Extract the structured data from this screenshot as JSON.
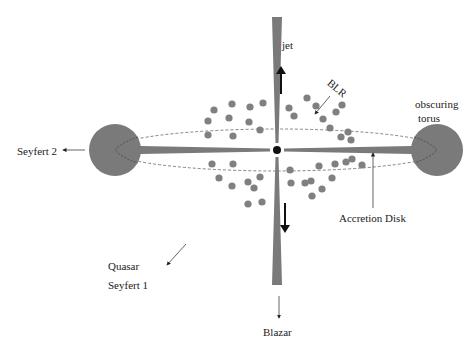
{
  "colors": {
    "background": "#ffffff",
    "structure_gray": "#7a7a7a",
    "blob_gray": "#808080",
    "dark": "#111111",
    "text": "#222222"
  },
  "labels": {
    "jet": "jet",
    "blr": "BLR",
    "obscuring": "obscuring",
    "torus": "torus",
    "seyfert2": "Seyfert 2",
    "accretion_disk": "Accretion Disk",
    "quasar": "Quasar",
    "seyfert1": "Seyfert 1",
    "blazar": "Blazar"
  },
  "geometry": {
    "center": [
      277,
      150
    ],
    "left_torus": {
      "cx": 115,
      "cy": 150,
      "r": 26
    },
    "right_torus": {
      "cx": 437,
      "cy": 150,
      "r": 26
    },
    "ellipse": {
      "cx": 277,
      "cy": 150,
      "rx": 165,
      "ry": 22
    },
    "jet_top_y": 17,
    "jet_bottom_y": 285
  },
  "blobs": [
    [
      263,
      103
    ],
    [
      232,
      104
    ],
    [
      214,
      110
    ],
    [
      208,
      121
    ],
    [
      229,
      118
    ],
    [
      250,
      107
    ],
    [
      249,
      122
    ],
    [
      208,
      135
    ],
    [
      233,
      136
    ],
    [
      260,
      130
    ],
    [
      289,
      108
    ],
    [
      294,
      116
    ],
    [
      307,
      98
    ],
    [
      316,
      106
    ],
    [
      323,
      119
    ],
    [
      336,
      112
    ],
    [
      330,
      128
    ],
    [
      341,
      137
    ],
    [
      348,
      132
    ],
    [
      351,
      140
    ],
    [
      342,
      105
    ],
    [
      212,
      164
    ],
    [
      233,
      164
    ],
    [
      219,
      178
    ],
    [
      232,
      186
    ],
    [
      248,
      182
    ],
    [
      254,
      188
    ],
    [
      260,
      177
    ],
    [
      248,
      204
    ],
    [
      262,
      202
    ],
    [
      290,
      170
    ],
    [
      291,
      183
    ],
    [
      305,
      183
    ],
    [
      311,
      181
    ],
    [
      312,
      196
    ],
    [
      322,
      189
    ],
    [
      319,
      166
    ],
    [
      335,
      164
    ],
    [
      332,
      178
    ],
    [
      346,
      162
    ],
    [
      352,
      159
    ],
    [
      362,
      165
    ]
  ]
}
